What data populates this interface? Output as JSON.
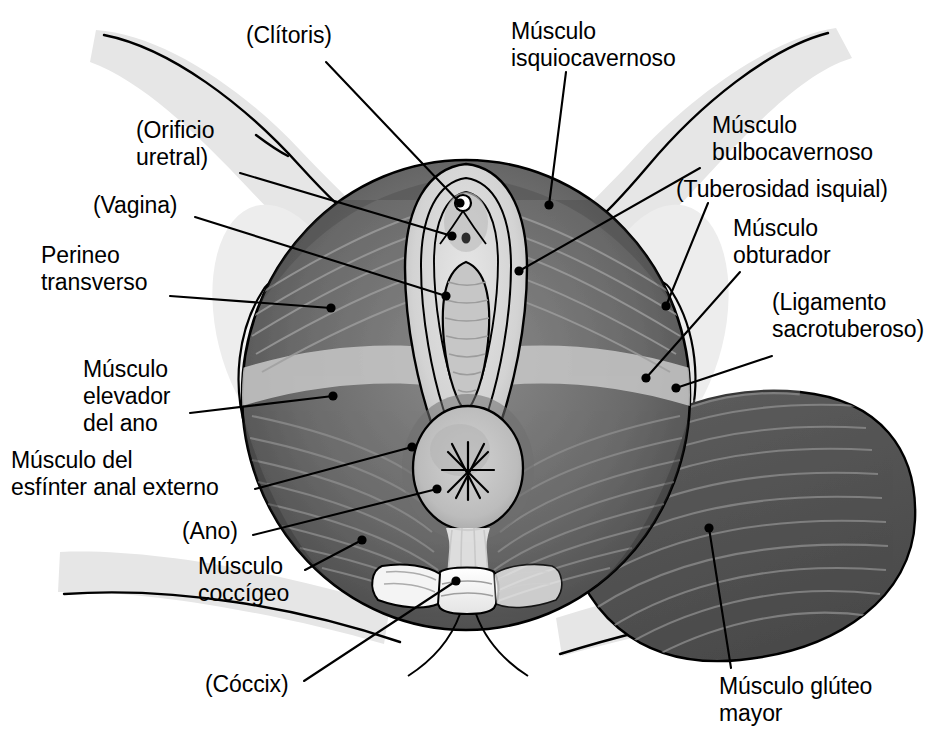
{
  "figure": {
    "language": "es",
    "style": "grayscale medical illustration",
    "background_color": "#ffffff",
    "line_color": "#000000"
  },
  "palette": {
    "skin_shadow": "#e2e2e2",
    "skin_light": "#f2f2f2",
    "bone_light": "#ececec",
    "muscle_mid": "#6e6e6e",
    "muscle_dark": "#4a4a4a",
    "muscle_darkest": "#3a3a3a",
    "gluteus": "#565656",
    "mucosa": "#c9c9c9",
    "mucosa_light": "#dcdcdc",
    "outline": "#000000"
  },
  "labels": [
    {
      "id": "clitoris",
      "text": "(Clítoris)",
      "align": "left",
      "x": 246,
      "y": 22,
      "leader": {
        "from": [
          326,
          62
        ],
        "to": [
          460,
          203
        ]
      },
      "marker": "dot"
    },
    {
      "id": "musculo-isquiocavernoso",
      "text": "Músculo\nisquiocavernoso",
      "align": "left",
      "x": 511,
      "y": 18,
      "leader": {
        "from": [
          566,
          72
        ],
        "to": [
          549,
          205
        ]
      },
      "marker": "dot"
    },
    {
      "id": "orificio-uretral",
      "text": "(Orificio\nuretral)",
      "align": "left",
      "x": 136,
      "y": 117,
      "leader": {
        "from": [
          240,
          173
        ],
        "to": [
          452,
          236
        ]
      },
      "marker": "dot"
    },
    {
      "id": "musculo-bulbocavernoso",
      "text": "Músculo\nbulbocavernoso",
      "align": "left",
      "x": 712,
      "y": 112,
      "leader": {
        "from": [
          700,
          168
        ],
        "to": [
          519,
          271
        ]
      },
      "marker": "dot"
    },
    {
      "id": "tuberosidad-isquial",
      "text": "(Tuberosidad isquial)",
      "align": "left",
      "x": 676,
      "y": 176,
      "leader": {
        "from": [
          708,
          203
        ],
        "to": [
          666,
          306
        ]
      },
      "marker": "dot"
    },
    {
      "id": "vagina",
      "text": "(Vagina)",
      "align": "left",
      "x": 93,
      "y": 192,
      "leader": {
        "from": [
          195,
          217
        ],
        "to": [
          446,
          296
        ]
      },
      "marker": "dot"
    },
    {
      "id": "musculo-obturador",
      "text": "Músculo\nobturador",
      "align": "left",
      "x": 733,
      "y": 215,
      "leader": {
        "from": [
          740,
          272
        ],
        "to": [
          646,
          378
        ]
      },
      "marker": "dot"
    },
    {
      "id": "perineo-transverso",
      "text": "Perineo\ntransverso",
      "align": "left",
      "x": 41,
      "y": 242,
      "leader": {
        "from": [
          170,
          296
        ],
        "to": [
          331,
          308
        ]
      },
      "marker": "dot"
    },
    {
      "id": "ligamento-sacrotuberoso",
      "text": "(Ligamento\nsacrotuberoso)",
      "align": "left",
      "x": 772,
      "y": 289,
      "leader": {
        "from": [
          772,
          356
        ],
        "to": [
          676,
          388
        ]
      },
      "marker": "dot"
    },
    {
      "id": "musculo-elevador-del-ano",
      "text": "Músculo\nelevador\ndel ano",
      "align": "left",
      "x": 83,
      "y": 356,
      "leader": {
        "from": [
          190,
          413
        ],
        "to": [
          333,
          396
        ]
      },
      "marker": "dot"
    },
    {
      "id": "musculo-esfinter-anal-externo",
      "text": "Músculo del\nesfínter anal externo",
      "align": "left",
      "x": 11,
      "y": 447,
      "leader": {
        "from": [
          255,
          489
        ],
        "to": [
          412,
          447
        ]
      },
      "marker": "dot"
    },
    {
      "id": "ano",
      "text": "(Ano)",
      "align": "left",
      "x": 182,
      "y": 518,
      "leader": {
        "from": [
          253,
          535
        ],
        "to": [
          437,
          489
        ]
      },
      "marker": "dot"
    },
    {
      "id": "musculo-coccigeo",
      "text": "Músculo\ncoccígeo",
      "align": "left",
      "x": 198,
      "y": 553,
      "leader": {
        "from": [
          305,
          570
        ],
        "to": [
          362,
          540
        ]
      },
      "marker": "dot"
    },
    {
      "id": "coccix",
      "text": "(Cóccix)",
      "align": "left",
      "x": 205,
      "y": 671,
      "leader": {
        "from": [
          304,
          681
        ],
        "to": [
          456,
          581
        ]
      },
      "marker": "dot"
    },
    {
      "id": "musculo-circular-gluteo-mayor",
      "text": "Músculo glúteo\nmayor",
      "align": "left",
      "x": 719,
      "y": 673,
      "leader": {
        "from": [
          731,
          668
        ],
        "to": [
          709,
          528
        ]
      },
      "marker": "dot"
    }
  ]
}
